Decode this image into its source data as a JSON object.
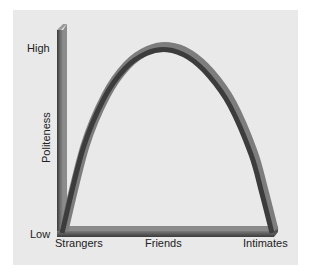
{
  "chart_data": {
    "type": "line",
    "title": "",
    "xlabel": "",
    "ylabel": "Politeness",
    "x_tick_labels": [
      "Strangers",
      "Friends",
      "Intimates"
    ],
    "y_tick_labels": [
      "Low",
      "High"
    ],
    "xlim": [
      0,
      1
    ],
    "ylim": [
      0,
      1
    ],
    "grid": false,
    "legend": "none",
    "series": [
      {
        "name": "Politeness",
        "x": [
          0.0,
          0.1,
          0.2,
          0.3,
          0.4,
          0.5,
          0.6,
          0.7,
          0.8,
          0.9,
          0.95,
          1.0
        ],
        "y": [
          0.0,
          0.45,
          0.72,
          0.88,
          0.96,
          0.98,
          0.94,
          0.84,
          0.68,
          0.42,
          0.22,
          0.0
        ]
      }
    ]
  }
}
